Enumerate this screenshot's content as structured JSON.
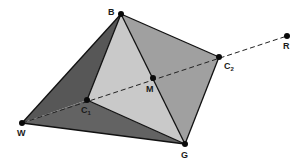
{
  "diagram": {
    "type": "color-space-tetrahedron",
    "points": {
      "B": {
        "label": "B",
        "x": 121,
        "y": 14
      },
      "R": {
        "label": "R",
        "x": 287,
        "y": 36
      },
      "C2": {
        "label": "C",
        "sub": "2",
        "x": 219,
        "y": 57
      },
      "M": {
        "label": "M",
        "x": 153,
        "y": 78
      },
      "C1": {
        "label": "C",
        "sub": "1",
        "x": 87,
        "y": 100
      },
      "W": {
        "label": "W",
        "x": 22,
        "y": 123
      },
      "G": {
        "label": "G",
        "x": 185,
        "y": 144
      }
    },
    "faces": [
      {
        "name": "face-W-B-C1",
        "vertices": [
          "W",
          "B",
          "C1"
        ],
        "color": "#575757"
      },
      {
        "name": "face-W-C1-G",
        "vertices": [
          "W",
          "C1",
          "G"
        ],
        "color": "#636363"
      },
      {
        "name": "face-B-C1-G",
        "vertices": [
          "B",
          "C1",
          "G"
        ],
        "color": "#c9c9c9"
      },
      {
        "name": "face-B-C2-G",
        "vertices": [
          "B",
          "C2",
          "G"
        ],
        "color": "#a0a0a0"
      }
    ],
    "dashed_line": [
      "W",
      "R"
    ],
    "colors": {
      "edge": "#111111",
      "dash": "#222222",
      "point": "#0a0a0a"
    }
  }
}
